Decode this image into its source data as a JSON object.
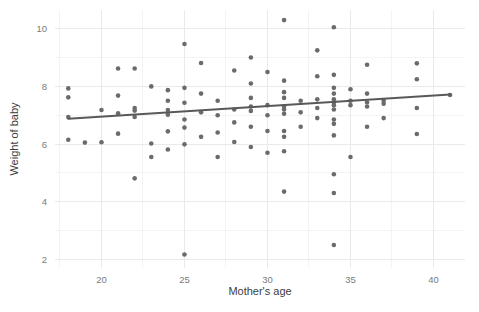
{
  "chart_data": {
    "type": "scatter",
    "title": "",
    "xlabel": "Mother's age",
    "ylabel": "Weight of baby",
    "xlim": [
      17.2,
      41.9
    ],
    "ylim": [
      1.7,
      10.65
    ],
    "xticks": [
      20,
      25,
      30,
      35,
      40
    ],
    "xticklabels": [
      "20",
      "25",
      "30",
      "35",
      "40"
    ],
    "yticks": [
      2,
      4,
      6,
      8,
      10
    ],
    "yticklabels": [
      "2",
      "4",
      "6",
      "8",
      "10"
    ],
    "x_minor_ticks": [
      17.5,
      22.5,
      27.5,
      32.5,
      37.5
    ],
    "y_minor_ticks": [
      3,
      5,
      7,
      9
    ],
    "grid": true,
    "legend": false,
    "point_color": "#6b6b6b",
    "line_color": "#595959",
    "grid_color": "#eaeaea",
    "minor_grid_color": "#f4f4f4",
    "background": "#ffffff",
    "point_radius": 2.3,
    "trend": {
      "name": "linear fit",
      "x": [
        18.0,
        41.0
      ],
      "y": [
        6.88,
        7.72
      ]
    },
    "series": [
      {
        "name": "births",
        "points": [
          [
            18.0,
            7.93
          ],
          [
            18.0,
            7.62
          ],
          [
            18.0,
            6.94
          ],
          [
            18.0,
            6.15
          ],
          [
            19.0,
            6.05
          ],
          [
            20.0,
            6.06
          ],
          [
            20.0,
            7.18
          ],
          [
            21.0,
            8.62
          ],
          [
            21.0,
            7.68
          ],
          [
            21.0,
            7.07
          ],
          [
            21.0,
            6.36
          ],
          [
            22.0,
            8.62
          ],
          [
            22.0,
            7.25
          ],
          [
            22.0,
            7.16
          ],
          [
            22.0,
            6.94
          ],
          [
            22.0,
            4.81
          ],
          [
            23.0,
            8.0
          ],
          [
            23.0,
            6.02
          ],
          [
            23.0,
            5.55
          ],
          [
            24.0,
            7.87
          ],
          [
            24.0,
            7.5
          ],
          [
            24.0,
            7.18
          ],
          [
            24.0,
            7.02
          ],
          [
            24.0,
            6.44
          ],
          [
            24.0,
            5.81
          ],
          [
            25.0,
            9.47
          ],
          [
            25.0,
            7.95
          ],
          [
            25.0,
            7.43
          ],
          [
            25.0,
            6.85
          ],
          [
            25.0,
            6.57
          ],
          [
            25.0,
            5.99
          ],
          [
            25.0,
            2.17
          ],
          [
            26.0,
            8.81
          ],
          [
            26.0,
            7.75
          ],
          [
            26.0,
            7.1
          ],
          [
            26.0,
            6.25
          ],
          [
            27.0,
            7.5
          ],
          [
            27.0,
            7.0
          ],
          [
            27.0,
            6.4
          ],
          [
            27.0,
            5.55
          ],
          [
            28.0,
            8.55
          ],
          [
            28.0,
            7.2
          ],
          [
            28.0,
            6.75
          ],
          [
            28.0,
            6.07
          ],
          [
            29.0,
            9.0
          ],
          [
            29.0,
            8.1
          ],
          [
            29.0,
            7.6
          ],
          [
            29.0,
            7.3
          ],
          [
            29.0,
            7.15
          ],
          [
            29.0,
            6.6
          ],
          [
            29.0,
            5.9
          ],
          [
            30.0,
            8.5
          ],
          [
            30.0,
            7.35
          ],
          [
            30.0,
            7.0
          ],
          [
            30.0,
            6.45
          ],
          [
            30.0,
            5.7
          ],
          [
            31.0,
            10.3
          ],
          [
            31.0,
            8.2
          ],
          [
            31.0,
            7.8
          ],
          [
            31.0,
            7.6
          ],
          [
            31.0,
            7.3
          ],
          [
            31.0,
            7.2
          ],
          [
            31.0,
            7.05
          ],
          [
            31.0,
            6.45
          ],
          [
            31.0,
            6.25
          ],
          [
            31.0,
            5.75
          ],
          [
            31.0,
            4.35
          ],
          [
            32.0,
            7.5
          ],
          [
            32.0,
            7.1
          ],
          [
            32.0,
            6.6
          ],
          [
            33.0,
            9.25
          ],
          [
            33.0,
            8.35
          ],
          [
            33.0,
            7.55
          ],
          [
            33.0,
            7.25
          ],
          [
            33.0,
            6.9
          ],
          [
            34.0,
            10.05
          ],
          [
            34.0,
            8.4
          ],
          [
            34.0,
            7.95
          ],
          [
            34.0,
            7.75
          ],
          [
            34.0,
            7.55
          ],
          [
            34.0,
            7.45
          ],
          [
            34.0,
            7.35
          ],
          [
            34.0,
            7.2
          ],
          [
            34.0,
            6.85
          ],
          [
            34.0,
            6.7
          ],
          [
            34.0,
            6.3
          ],
          [
            34.0,
            4.95
          ],
          [
            34.0,
            4.3
          ],
          [
            34.0,
            2.5
          ],
          [
            35.0,
            7.9
          ],
          [
            35.0,
            7.5
          ],
          [
            35.0,
            7.35
          ],
          [
            35.0,
            5.55
          ],
          [
            36.0,
            8.75
          ],
          [
            36.0,
            7.75
          ],
          [
            36.0,
            7.45
          ],
          [
            36.0,
            7.3
          ],
          [
            36.0,
            6.6
          ],
          [
            37.0,
            7.5
          ],
          [
            37.0,
            7.4
          ],
          [
            37.0,
            6.9
          ],
          [
            39.0,
            8.8
          ],
          [
            39.0,
            8.25
          ],
          [
            39.0,
            7.25
          ],
          [
            39.0,
            6.35
          ],
          [
            41.0,
            7.7
          ]
        ]
      }
    ]
  },
  "axis": {
    "x_title": "Mother's age",
    "y_title": "Weight of baby"
  }
}
